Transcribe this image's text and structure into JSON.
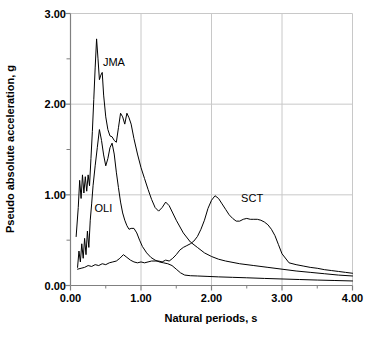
{
  "figure": {
    "background_color": "#ffffff",
    "axis_color": "#808080",
    "grid_color": "#c8c8c8",
    "curve_color": "#000000"
  },
  "axes": {
    "x_title": "Natural periods, s",
    "y_title": "Pseudo absolute acceleration, g",
    "x_tick_labels": [
      "0.00",
      "1.00",
      "2.00",
      "3.00",
      "4.00"
    ],
    "y_tick_labels": [
      "0.00",
      "1.00",
      "2.00",
      "3.00"
    ],
    "x_minor_ticks": [
      0.5,
      1.5,
      2.5,
      3.5
    ],
    "y_minor_ticks": [
      0.5,
      1.5,
      2.5
    ]
  },
  "annotations": {
    "jma_label": "JMA",
    "oli_label": "OLI",
    "sct_label": "SCT"
  },
  "caption_fragment": "",
  "chart_data": {
    "type": "line",
    "title": "",
    "subtitle": "",
    "xlabel": "Natural periods, s",
    "ylabel": "Pseudo absolute acceleration, g",
    "xlim": [
      0.0,
      4.0
    ],
    "ylim": [
      0.0,
      3.0
    ],
    "xticks": [
      0.0,
      1.0,
      2.0,
      3.0,
      4.0
    ],
    "yticks": [
      0.0,
      1.0,
      2.0,
      3.0
    ],
    "xtick_labels": [
      "0.00",
      "1.00",
      "2.00",
      "3.00",
      "4.00"
    ],
    "ytick_labels": [
      "0.00",
      "1.00",
      "2.00",
      "3.00"
    ],
    "grid": true,
    "grid_axes": "both",
    "legend": "inline-annotations",
    "legend_position": "in-plot",
    "series": [
      {
        "name": "JMA",
        "label_position": {
          "x": 0.46,
          "y": 2.47
        },
        "x": [
          0.08,
          0.11,
          0.13,
          0.15,
          0.17,
          0.19,
          0.21,
          0.23,
          0.25,
          0.27,
          0.29,
          0.31,
          0.33,
          0.35,
          0.37,
          0.39,
          0.41,
          0.43,
          0.45,
          0.47,
          0.5,
          0.53,
          0.56,
          0.59,
          0.62,
          0.65,
          0.68,
          0.71,
          0.74,
          0.77,
          0.8,
          0.83,
          0.86,
          0.9,
          0.95,
          1.0,
          1.05,
          1.1,
          1.15,
          1.2,
          1.25,
          1.3,
          1.35,
          1.4,
          1.45,
          1.5,
          1.6,
          1.7,
          1.8,
          1.9,
          2.0,
          2.1,
          2.2,
          2.4,
          2.6,
          2.8,
          3.0,
          3.2,
          3.4,
          3.6,
          3.8,
          4.0
        ],
        "y": [
          0.54,
          0.86,
          1.16,
          0.96,
          1.22,
          1.02,
          1.2,
          1.04,
          1.22,
          1.1,
          1.4,
          1.7,
          2.05,
          2.4,
          2.72,
          2.5,
          2.27,
          2.32,
          2.35,
          2.1,
          1.86,
          1.72,
          1.65,
          1.64,
          1.6,
          1.58,
          1.74,
          1.9,
          1.86,
          1.78,
          1.9,
          1.85,
          1.78,
          1.62,
          1.45,
          1.3,
          1.18,
          1.06,
          0.95,
          0.86,
          0.82,
          0.86,
          0.92,
          0.88,
          0.8,
          0.72,
          0.58,
          0.48,
          0.42,
          0.36,
          0.32,
          0.29,
          0.27,
          0.24,
          0.22,
          0.2,
          0.18,
          0.16,
          0.145,
          0.13,
          0.115,
          0.105
        ]
      },
      {
        "name": "OLI",
        "label_position": {
          "x": 0.34,
          "y": 0.86
        },
        "x": [
          0.1,
          0.12,
          0.14,
          0.16,
          0.18,
          0.2,
          0.22,
          0.24,
          0.26,
          0.28,
          0.3,
          0.32,
          0.35,
          0.38,
          0.41,
          0.44,
          0.47,
          0.5,
          0.53,
          0.56,
          0.59,
          0.62,
          0.65,
          0.68,
          0.71,
          0.74,
          0.77,
          0.8,
          0.83,
          0.86,
          0.9,
          0.94,
          0.98,
          1.02,
          1.08,
          1.14,
          1.2,
          1.26,
          1.32,
          1.38,
          1.44,
          1.5,
          1.56,
          1.62,
          1.7,
          1.8,
          1.95,
          2.1,
          2.3,
          2.5,
          2.75,
          3.0,
          3.25,
          3.5,
          3.75,
          4.0
        ],
        "y": [
          0.2,
          0.38,
          0.26,
          0.46,
          0.3,
          0.52,
          0.34,
          0.6,
          0.42,
          0.72,
          0.9,
          1.1,
          1.32,
          1.52,
          1.72,
          1.6,
          1.44,
          1.32,
          1.4,
          1.52,
          1.57,
          1.45,
          1.25,
          1.08,
          0.92,
          0.8,
          0.72,
          0.66,
          0.62,
          0.63,
          0.63,
          0.58,
          0.5,
          0.43,
          0.36,
          0.31,
          0.28,
          0.26,
          0.25,
          0.24,
          0.22,
          0.18,
          0.14,
          0.115,
          0.108,
          0.105,
          0.1,
          0.095,
          0.09,
          0.085,
          0.078,
          0.072,
          0.066,
          0.06,
          0.055,
          0.05
        ]
      },
      {
        "name": "SCT",
        "label_position": {
          "x": 2.42,
          "y": 0.97
        },
        "x": [
          0.1,
          0.15,
          0.2,
          0.25,
          0.3,
          0.35,
          0.4,
          0.45,
          0.5,
          0.55,
          0.6,
          0.65,
          0.7,
          0.75,
          0.8,
          0.85,
          0.9,
          0.95,
          1.0,
          1.05,
          1.1,
          1.15,
          1.2,
          1.25,
          1.3,
          1.35,
          1.4,
          1.45,
          1.5,
          1.55,
          1.6,
          1.65,
          1.7,
          1.75,
          1.8,
          1.85,
          1.9,
          1.95,
          2.0,
          2.05,
          2.1,
          2.15,
          2.2,
          2.25,
          2.3,
          2.35,
          2.4,
          2.45,
          2.5,
          2.55,
          2.6,
          2.65,
          2.7,
          2.75,
          2.8,
          2.85,
          2.9,
          2.95,
          3.0,
          3.1,
          3.2,
          3.3,
          3.4,
          3.5,
          3.6,
          3.7,
          3.8,
          3.9,
          4.0
        ],
        "y": [
          0.18,
          0.19,
          0.2,
          0.22,
          0.21,
          0.23,
          0.22,
          0.24,
          0.23,
          0.25,
          0.26,
          0.27,
          0.3,
          0.34,
          0.31,
          0.28,
          0.26,
          0.25,
          0.26,
          0.25,
          0.26,
          0.27,
          0.27,
          0.27,
          0.26,
          0.28,
          0.27,
          0.3,
          0.34,
          0.39,
          0.42,
          0.44,
          0.46,
          0.49,
          0.54,
          0.62,
          0.72,
          0.85,
          0.94,
          0.99,
          0.96,
          0.9,
          0.84,
          0.78,
          0.74,
          0.71,
          0.71,
          0.73,
          0.74,
          0.73,
          0.73,
          0.73,
          0.72,
          0.7,
          0.67,
          0.62,
          0.55,
          0.45,
          0.35,
          0.25,
          0.23,
          0.215,
          0.2,
          0.19,
          0.175,
          0.165,
          0.155,
          0.145,
          0.135
        ]
      }
    ]
  }
}
